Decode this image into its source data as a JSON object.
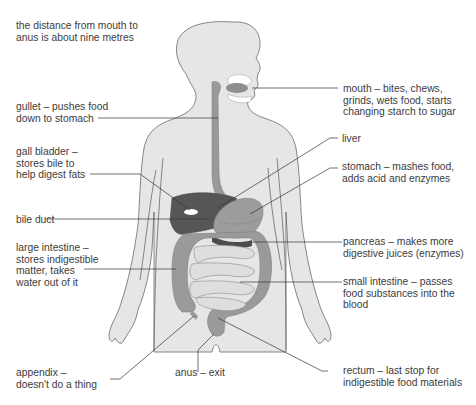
{
  "diagram": {
    "type": "anatomy",
    "colors": {
      "body_fill": "#e6e6e6",
      "body_outline": "#6a6a6a",
      "liver": "#5a5a5a",
      "organ_mid": "#9a9a9a",
      "small_intestine": "#dcdcdc",
      "leader_line": "#333333"
    }
  },
  "note": {
    "lines": [
      "the distance from mouth to",
      "anus is about nine metres"
    ]
  },
  "labels": {
    "gullet": {
      "lines": [
        "gullet – pushes food",
        "down to stomach"
      ]
    },
    "gall_bladder": {
      "lines": [
        "gall bladder –",
        "stores bile to",
        "help digest fats"
      ]
    },
    "bile_duct": {
      "lines": [
        "bile duct"
      ]
    },
    "large_intestine": {
      "lines": [
        "large intestine –",
        "stores indigestible",
        "matter, takes",
        "water out of it"
      ]
    },
    "appendix": {
      "lines": [
        "appendix –",
        "doesn't do a thing"
      ]
    },
    "anus": {
      "lines": [
        "anus – exit"
      ]
    },
    "mouth": {
      "lines": [
        "mouth – bites, chews,",
        "grinds, wets food, starts",
        "changing starch to sugar"
      ]
    },
    "liver": {
      "lines": [
        "liver"
      ]
    },
    "stomach": {
      "lines": [
        "stomach – mashes food,",
        "adds acid and enzymes"
      ]
    },
    "pancreas": {
      "lines": [
        "pancreas – makes more",
        "digestive juices (enzymes)"
      ]
    },
    "small_intestine": {
      "lines": [
        "small intestine – passes",
        "food substances into the",
        "blood"
      ]
    },
    "rectum": {
      "lines": [
        "rectum – last stop for",
        "indigestible food materials"
      ]
    }
  }
}
